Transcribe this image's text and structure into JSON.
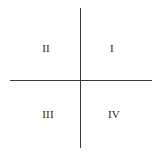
{
  "figure": {
    "name": "cartesian-quadrant-diagram",
    "width": 156,
    "height": 155,
    "background_color": "#ffffff",
    "axis_color": "#3a3a3c",
    "label_color": "#1e1e20"
  },
  "axes": {
    "vertical": {
      "name": "y-axis",
      "x": 81,
      "y_start": 8,
      "y_end": 148,
      "stroke_width": 1.4
    },
    "horizontal": {
      "name": "x-axis",
      "y": 81,
      "x_start": 10,
      "x_end": 152,
      "stroke_width": 1.4
    },
    "origin": {
      "x": 81,
      "y": 81
    }
  },
  "quadrants": [
    {
      "id": "q1",
      "label": "I",
      "position": "upper-right",
      "x": 112,
      "y": 48
    },
    {
      "id": "q2",
      "label": "II",
      "position": "upper-left",
      "x": 46,
      "y": 48
    },
    {
      "id": "q3",
      "label": "III",
      "position": "lower-left",
      "x": 48,
      "y": 114
    },
    {
      "id": "q4",
      "label": "IV",
      "position": "lower-right",
      "x": 114,
      "y": 114
    }
  ]
}
